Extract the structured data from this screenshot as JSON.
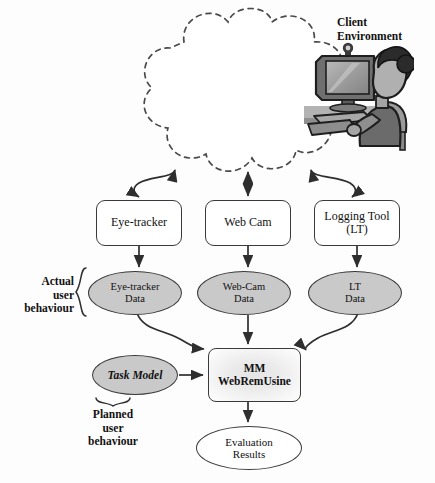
{
  "diagram": {
    "title_label": "Client Environment",
    "labels": {
      "client_environment": "Client\nEnvironment",
      "actual_user_behaviour": "Actual\nuser\nbehaviour",
      "planned_user_behaviour": "Planned\nuser\nbehaviour"
    },
    "illustration": {
      "name": "user-at-computer-illustration",
      "description": "Person seated at a desktop computer with a webcam mounted on the monitor",
      "container_shape": "dashed-cloud"
    },
    "nodes": {
      "eye_tracker": "Eye-tracker",
      "web_cam": "Web Cam",
      "logging_tool": "Logging Tool\n(LT)",
      "eye_tracker_data": "Eye-tracker\nData",
      "web_cam_data": "Web-Cam\nData",
      "lt_data": "LT\nData",
      "task_model": "Task Model",
      "mm_webremusine": "MM\nWebRemUsine",
      "evaluation_results": "Evaluation\nResults"
    },
    "colors": {
      "data_ellipse_fill": "#c9c9c9",
      "box_fill": "#ffffff",
      "stroke": "#3a3a3a",
      "text": "#111111",
      "mm_box_gradient_center": "#e4e4e4",
      "mm_box_gradient_edge": "#ffffff",
      "background": "#fdfdfd"
    },
    "edges": [
      {
        "from": "client-environment-cloud",
        "to": "eye-tracker",
        "style": "curved-double-headed"
      },
      {
        "from": "client-environment-cloud",
        "to": "web-cam",
        "style": "straight-double-headed"
      },
      {
        "from": "client-environment-cloud",
        "to": "logging-tool",
        "style": "curved-double-headed"
      },
      {
        "from": "eye-tracker",
        "to": "eye-tracker-data",
        "style": "straight"
      },
      {
        "from": "web-cam",
        "to": "web-cam-data",
        "style": "straight"
      },
      {
        "from": "logging-tool",
        "to": "lt-data",
        "style": "straight"
      },
      {
        "from": "eye-tracker-data",
        "to": "mm-webremusine",
        "style": "curved"
      },
      {
        "from": "web-cam-data",
        "to": "mm-webremusine",
        "style": "straight"
      },
      {
        "from": "lt-data",
        "to": "mm-webremusine",
        "style": "curved"
      },
      {
        "from": "task-model",
        "to": "mm-webremusine",
        "style": "straight"
      },
      {
        "from": "mm-webremusine",
        "to": "evaluation-results",
        "style": "straight"
      }
    ]
  }
}
